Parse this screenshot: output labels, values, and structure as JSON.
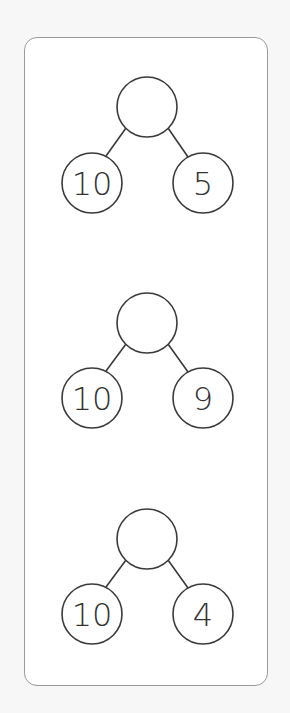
{
  "worksheet": {
    "title": "",
    "colors": {
      "stroke": "#3a3a3a",
      "text": "#333333",
      "card_border": "#9a9a9a",
      "background": "#f7f7f7"
    },
    "trees": [
      {
        "top": {
          "value": "",
          "cx": 147,
          "cy": 107
        },
        "left": {
          "value": "10",
          "cx": 92,
          "cy": 183
        },
        "right": {
          "value": "5",
          "cx": 203,
          "cy": 183
        }
      },
      {
        "top": {
          "value": "",
          "cx": 147,
          "cy": 323
        },
        "left": {
          "value": "10",
          "cx": 92,
          "cy": 398
        },
        "right": {
          "value": "9",
          "cx": 203,
          "cy": 398
        }
      },
      {
        "top": {
          "value": "",
          "cx": 147,
          "cy": 539
        },
        "left": {
          "value": "10",
          "cx": 92,
          "cy": 614
        },
        "right": {
          "value": "4",
          "cx": 203,
          "cy": 614
        }
      }
    ]
  }
}
